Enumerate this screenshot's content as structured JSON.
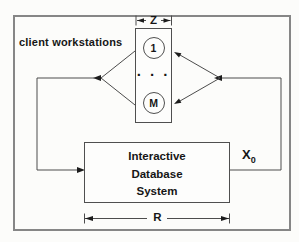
{
  "diagram": {
    "title_note": "closed queueing model of an interactive database system",
    "client_workstations_label": "client workstations",
    "z_label": "Z",
    "r_label": "R",
    "x0": {
      "base": "X",
      "subscript": "0"
    },
    "workstations": {
      "first_node": "1",
      "ellipsis": "· · ·",
      "last_node": "M"
    },
    "ids_box": {
      "line1": "Interactive",
      "line2": "Database",
      "line3": "System"
    },
    "colors": {
      "line": "#4c4c4c",
      "text": "#161616",
      "frame": "#868686",
      "background": "#fcfcfa",
      "box_border": "#4f4f4f",
      "box_fill": "#fdfdfc"
    }
  }
}
